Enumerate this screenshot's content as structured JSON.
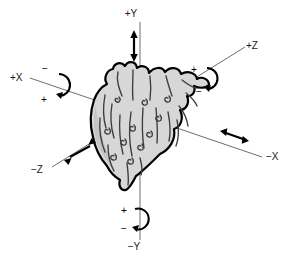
{
  "diagram": {
    "background_color": "#ffffff",
    "axis_color": "#6e6e6e",
    "organ_fill_color": "#d7d7d7",
    "organ_outline_color": "#000000",
    "marker_color": "#000000"
  },
  "axes": [
    {
      "id": "plus-y",
      "label": "+Y",
      "label_x": 131,
      "label_y": 17,
      "motion": "translation"
    },
    {
      "id": "minus-y",
      "label": "−Y",
      "label_x": 130,
      "label_y": 250,
      "motion": "rotation"
    },
    {
      "id": "plus-x",
      "label": "+X",
      "label_x": 10,
      "label_y": 81,
      "motion": "rotation"
    },
    {
      "id": "minus-x",
      "label": "−X",
      "label_x": 266,
      "label_y": 157,
      "motion": "translation"
    },
    {
      "id": "plus-z",
      "label": "+Z",
      "label_x": 247,
      "label_y": 51,
      "motion": "rotation"
    },
    {
      "id": "minus-z",
      "label": "−Z",
      "label_x": 36,
      "label_y": 171,
      "motion": "translation"
    }
  ],
  "rotation_markers": [
    {
      "id": "x-rotation",
      "plus": "+",
      "minus": "−",
      "minus_x": 50,
      "minus_y": 69,
      "plus_x": 47,
      "plus_y": 101
    },
    {
      "id": "z-rotation",
      "plus": "+",
      "minus": "−",
      "plus_x": 196,
      "plus_y": 70,
      "minus_x": 200,
      "minus_y": 91
    },
    {
      "id": "y-rotation",
      "plus": "+",
      "minus": "−",
      "plus_x": 125,
      "plus_y": 211,
      "minus_x": 125,
      "minus_y": 228
    }
  ],
  "translation_markers": [
    {
      "id": "y-translation-arrow",
      "axis": "+Y"
    },
    {
      "id": "x-translation-arrow",
      "axis": "−X"
    },
    {
      "id": "z-translation-arrow",
      "axis": "−Z"
    }
  ],
  "organ": {
    "name": "heart",
    "fill": "#d7d7d7",
    "outline": "#000000"
  }
}
